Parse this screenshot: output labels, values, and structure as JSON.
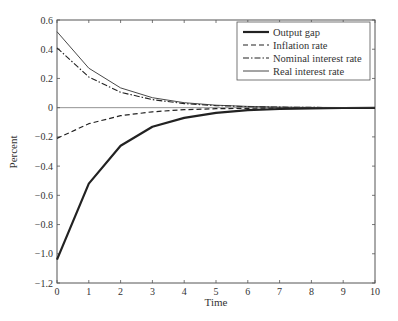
{
  "chart_data": {
    "type": "line",
    "title": "",
    "xlabel": "Time",
    "ylabel": "Percent",
    "xlim": [
      0,
      10
    ],
    "ylim": [
      -1.2,
      0.6
    ],
    "xticks": [
      0,
      1,
      2,
      3,
      4,
      5,
      6,
      7,
      8,
      9,
      10
    ],
    "xtick_labels": [
      "0",
      "1",
      "2",
      "3",
      "4",
      "5",
      "6",
      "7",
      "8",
      "9",
      "10"
    ],
    "yticks": [
      0.6,
      0.4,
      0.2,
      0,
      -0.2,
      -0.4,
      -0.6,
      -0.8,
      -1.0,
      -1.2
    ],
    "ytick_labels": [
      "0.6",
      "0.4",
      "0.2",
      "0",
      "−0.2",
      "−0.4",
      "−0.6",
      "−0.8",
      "−1.0",
      "−1.2"
    ],
    "grid": false,
    "zero_line": true,
    "legend_position": "upper right",
    "x": [
      0,
      1,
      2,
      3,
      4,
      5,
      6,
      7,
      8,
      9,
      10
    ],
    "series": [
      {
        "name": "Output gap",
        "style": "solid-thick",
        "values": [
          -1.04,
          -0.52,
          -0.26,
          -0.13,
          -0.07,
          -0.035,
          -0.017,
          -0.009,
          -0.004,
          -0.002,
          -0.001
        ]
      },
      {
        "name": "Inflation rate",
        "style": "dashed",
        "values": [
          -0.21,
          -0.11,
          -0.055,
          -0.028,
          -0.014,
          -0.007,
          -0.004,
          -0.002,
          -0.001,
          -0.0005,
          0
        ]
      },
      {
        "name": "Nominal interest rate",
        "style": "dashdot",
        "values": [
          0.41,
          0.21,
          0.105,
          0.055,
          0.028,
          0.014,
          0.007,
          0.004,
          0.002,
          0.001,
          0
        ]
      },
      {
        "name": "Real interest rate",
        "style": "solid-thin",
        "values": [
          0.52,
          0.27,
          0.135,
          0.068,
          0.034,
          0.017,
          0.009,
          0.004,
          0.002,
          0.001,
          0
        ]
      }
    ]
  }
}
